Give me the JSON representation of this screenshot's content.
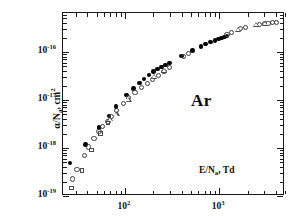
{
  "figure": {
    "species_label": "Ar",
    "background_color": "#ffffff",
    "frame_color": "#1a1a1a"
  },
  "chart_data": {
    "type": "scatter",
    "title": "",
    "subtitle": "",
    "xlabel": "E/N_a, Td",
    "xlabel_parts": {
      "base": "E/N",
      "sub": "a",
      "tail": ", Td"
    },
    "ylabel": "alpha/N_a, cm^2",
    "ylabel_parts": {
      "base": "α/N",
      "sub": "a",
      "tail": ", cm",
      "sup": "2"
    },
    "xscale": "log",
    "yscale": "log",
    "xlim": [
      22,
      5000
    ],
    "ylim": [
      1e-19,
      6.5e-16
    ],
    "grid": false,
    "legend": "none",
    "annotations": [
      {
        "text": "Ar",
        "x": 700,
        "y": 1.1e-17
      },
      {
        "text": "E/N_a, Td",
        "x": 900,
        "y": 4.5e-19
      }
    ],
    "x_tick_labels": [
      {
        "value": 100,
        "text": "10^2",
        "mantissa": "10",
        "exponent": "2"
      },
      {
        "value": 1000,
        "text": "10^3",
        "mantissa": "10",
        "exponent": "3"
      }
    ],
    "y_tick_labels": [
      {
        "value": 1e-16,
        "text": "10^-16",
        "mantissa": "10",
        "exponent": "-16"
      },
      {
        "value": 1e-17,
        "text": "10^-17",
        "mantissa": "10",
        "exponent": "-17"
      },
      {
        "value": 1e-18,
        "text": "10^-18",
        "mantissa": "10",
        "exponent": "-18"
      },
      {
        "value": 1e-19,
        "text": "10^-19",
        "mantissa": "10",
        "exponent": "-19"
      }
    ],
    "series": [
      {
        "name": "filled-circles",
        "marker": "filled-circle",
        "color": "#000000",
        "size": 4.6,
        "points": [
          [
            26,
            4.9e-19
          ],
          [
            38,
            1.18e-18
          ],
          [
            53,
            2.7e-18
          ],
          [
            68,
            4.6e-18
          ],
          [
            80,
            7.4e-18
          ],
          [
            104,
            1.27e-17
          ],
          [
            124,
            1.75e-17
          ],
          [
            142,
            2.25e-17
          ],
          [
            160,
            2.75e-17
          ],
          [
            180,
            3.3e-17
          ],
          [
            200,
            3.9e-17
          ],
          [
            222,
            4.4e-17
          ],
          [
            245,
            4.9e-17
          ],
          [
            268,
            5.4e-17
          ],
          [
            295,
            5.9e-17
          ],
          [
            400,
            8.3e-17
          ],
          [
            520,
            1.08e-16
          ],
          [
            640,
            1.32e-16
          ],
          [
            720,
            1.47e-16
          ],
          [
            810,
            1.62e-16
          ],
          [
            900,
            1.74e-16
          ],
          [
            980,
            1.85e-16
          ],
          [
            1060,
            1.96e-16
          ],
          [
            1140,
            2.07e-16
          ],
          [
            1210,
            2.16e-16
          ]
        ]
      },
      {
        "name": "open-circles",
        "marker": "open-circle",
        "color": "#3a3a3a",
        "size": 5.2,
        "points": [
          [
            28,
            2.25e-19
          ],
          [
            31,
            3.5e-19
          ],
          [
            37,
            7.1e-19
          ],
          [
            41,
            1.05e-18
          ],
          [
            47,
            1.6e-18
          ],
          [
            53,
            2.2e-18
          ],
          [
            58,
            2.85e-18
          ],
          [
            66,
            3.6e-18
          ],
          [
            72,
            4.5e-18
          ],
          [
            82,
            6e-18
          ],
          [
            96,
            8.3e-18
          ],
          [
            110,
            1.12e-17
          ],
          [
            128,
            1.45e-17
          ],
          [
            150,
            1.85e-17
          ],
          [
            172,
            2.25e-17
          ],
          [
            196,
            2.7e-17
          ],
          [
            225,
            3.3e-17
          ],
          [
            260,
            4e-17
          ],
          [
            300,
            4.7e-17
          ],
          [
            420,
            8e-17
          ],
          [
            470,
            9.2e-17
          ],
          [
            1210,
            2.35e-16
          ],
          [
            1350,
            2.55e-16
          ],
          [
            1700,
            3.05e-16
          ],
          [
            1900,
            3.2e-16
          ],
          [
            2700,
            3.8e-16
          ],
          [
            3000,
            3.9e-16
          ],
          [
            3300,
            4e-16
          ],
          [
            3700,
            4.1e-16
          ],
          [
            4100,
            4.15e-16
          ]
        ]
      },
      {
        "name": "open-triangles",
        "marker": "open-triangle",
        "color": "#4a4a4a",
        "size": 6.0,
        "points": [
          [
            70,
            4e-18
          ],
          [
            82,
            5.1e-18
          ],
          [
            110,
            1.02e-17
          ],
          [
            205,
            3.1e-17
          ],
          [
            260,
            4.1e-17
          ],
          [
            1600,
            2.95e-16
          ],
          [
            2500,
            3.75e-16
          ],
          [
            3100,
            3.95e-16
          ]
        ]
      },
      {
        "name": "open-squares",
        "marker": "open-square",
        "color": "#4a4a4a",
        "size": 4.4,
        "points": [
          [
            27,
            1.45e-19
          ],
          [
            35,
            3.4e-19
          ],
          [
            44,
            9e-19
          ],
          [
            55,
            2e-18
          ],
          [
            66,
            3.3e-18
          ]
        ]
      }
    ]
  }
}
